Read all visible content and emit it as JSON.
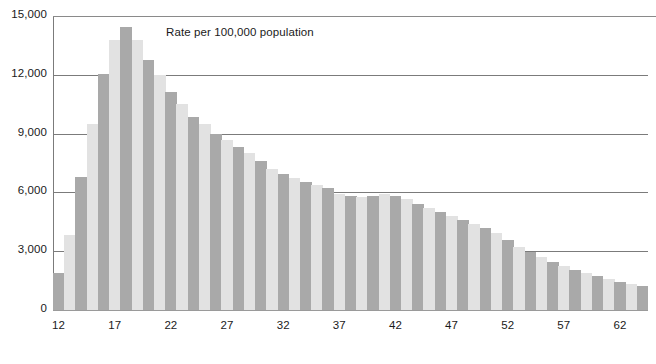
{
  "chart_data": {
    "type": "bar",
    "title": "",
    "annotation": "Rate per 100,000 population",
    "xlabel": "",
    "ylabel": "",
    "ylim": [
      0,
      15000
    ],
    "grid": true,
    "legend": "none",
    "y_ticks": [
      "0",
      "3,000",
      "6,000",
      "9,000",
      "12,000",
      "15,000"
    ],
    "y_tick_values": [
      0,
      3000,
      6000,
      9000,
      12000,
      15000
    ],
    "x_tick_labels": [
      "12",
      "17",
      "22",
      "27",
      "32",
      "37",
      "42",
      "47",
      "52",
      "57",
      "62"
    ],
    "x_tick_values": [
      12,
      17,
      22,
      27,
      32,
      37,
      42,
      47,
      52,
      57,
      62
    ],
    "bar_colors": {
      "dark": "#a9a9a9",
      "light": "#e2e2e2"
    },
    "categories": [
      12,
      13,
      14,
      15,
      16,
      17,
      18,
      19,
      20,
      21,
      22,
      23,
      24,
      25,
      26,
      27,
      28,
      29,
      30,
      31,
      32,
      33,
      34,
      35,
      36,
      37,
      38,
      39,
      40,
      41,
      42,
      43,
      44,
      45,
      46,
      47,
      48,
      49,
      50,
      51,
      52,
      53,
      54,
      55,
      56,
      57,
      58,
      59,
      60,
      61,
      62,
      63,
      64
    ],
    "values": [
      1900,
      3850,
      6800,
      9500,
      12050,
      13800,
      14450,
      13800,
      12750,
      12000,
      11100,
      10500,
      9850,
      9500,
      9000,
      8650,
      8300,
      8000,
      7600,
      7200,
      6950,
      6750,
      6550,
      6400,
      6200,
      5900,
      5800,
      5750,
      5800,
      5900,
      5800,
      5650,
      5400,
      5200,
      5000,
      4800,
      4600,
      4400,
      4200,
      3950,
      3550,
      3200,
      2950,
      2700,
      2450,
      2250,
      2050,
      1900,
      1750,
      1600,
      1450,
      1350,
      1250
    ]
  }
}
